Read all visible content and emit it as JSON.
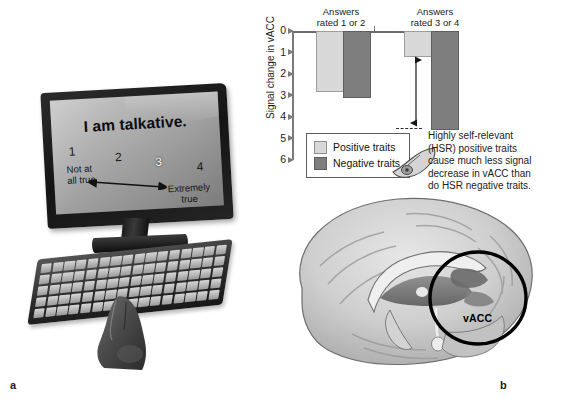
{
  "figure": {
    "panels": [
      {
        "letter": "a"
      },
      {
        "letter": "b"
      }
    ]
  },
  "panel_a": {
    "name": "self-rating-task-photo",
    "screen": {
      "question": "I am talkative.",
      "scale_numbers": [
        "1",
        "2",
        "3",
        "4"
      ],
      "selected_number": "3",
      "anchor_low": "Not at\nall true",
      "anchor_low_line1": "Not at",
      "anchor_low_line2": "all true",
      "anchor_high_line1": "Extremely",
      "anchor_high_line2": "true"
    },
    "devices": {
      "monitor": "computer-monitor",
      "keyboard": "computer-keyboard",
      "hand": "hand-pressing-key"
    }
  },
  "panel_b": {
    "name": "vacc-signal-change-and-brain",
    "callout": {
      "line1": "Highly self-relevant",
      "line2": "(HSR) positive traits",
      "line3": "cause much less signal",
      "line4": "decrease in vACC than",
      "line5": "do HSR negative traits.",
      "full_text": "Highly self-relevant (HSR) positive traits cause much less signal decrease in vACC than do HSR negative traits."
    },
    "brain": {
      "region_label": "vACC",
      "view": "mid-sagittal-brain"
    }
  },
  "chart_data": {
    "type": "bar",
    "title": "",
    "xlabel": "",
    "ylabel": "Signal change in vACC",
    "categories": [
      "Answers rated 1 or 2",
      "Answers rated 3 or 4"
    ],
    "category_lines": [
      {
        "line1": "Answers",
        "line2": "rated 1 or 2"
      },
      {
        "line1": "Answers",
        "line2": "rated 3 or 4"
      }
    ],
    "series": [
      {
        "name": "Positive traits",
        "color": "#d8d8d8",
        "values": [
          2.75,
          1.1
        ]
      },
      {
        "name": "Negative traits",
        "color": "#7e7e7e",
        "values": [
          3.0,
          4.5
        ]
      }
    ],
    "ylim": [
      0,
      6
    ],
    "y_ticks": [
      0,
      1,
      2,
      3,
      4,
      5,
      6
    ],
    "y_tick_labels": [
      "0",
      "1",
      "2",
      "3",
      "4",
      "5",
      "6"
    ],
    "y_axis_inverted": true,
    "grid": false,
    "legend_position": "inside-lower-left",
    "annotations": [
      {
        "type": "double-arrow",
        "label": "",
        "from_value": 1.1,
        "to_value": 4.5,
        "category": "Answers rated 3 or 4"
      }
    ]
  }
}
